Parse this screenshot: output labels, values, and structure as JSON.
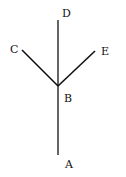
{
  "diagram": {
    "type": "tree",
    "nodes": [
      {
        "id": "A",
        "label": "A"
      },
      {
        "id": "B",
        "label": "B"
      },
      {
        "id": "C",
        "label": "C"
      },
      {
        "id": "D",
        "label": "D"
      },
      {
        "id": "E",
        "label": "E"
      }
    ],
    "edges": [
      {
        "from": "A",
        "to": "B"
      },
      {
        "from": "B",
        "to": "C"
      },
      {
        "from": "B",
        "to": "D"
      },
      {
        "from": "B",
        "to": "E"
      }
    ],
    "line_color": "#111111"
  }
}
